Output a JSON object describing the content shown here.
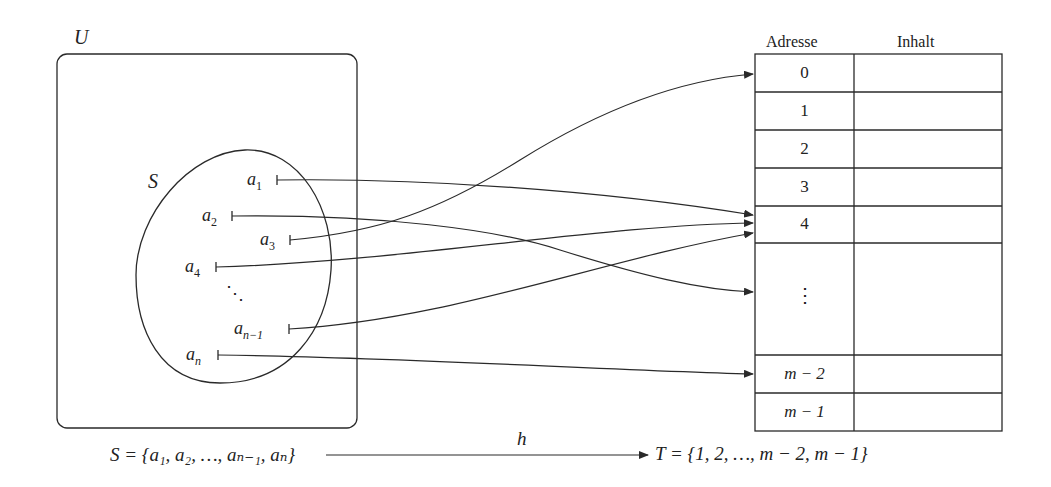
{
  "diagram": {
    "universe": {
      "label": "U"
    },
    "set_s": {
      "label": "S",
      "elements": [
        {
          "name": "a1",
          "base": "a",
          "sub": "1",
          "x": 277,
          "y": 180,
          "target_index": 4,
          "target_y": 215
        },
        {
          "name": "a2",
          "base": "a",
          "sub": "2",
          "x": 232,
          "y": 216,
          "target_index": "vdots",
          "target_y": 292
        },
        {
          "name": "a3",
          "base": "a",
          "sub": "3",
          "x": 290,
          "y": 240,
          "target_index": 0,
          "target_y": 74
        },
        {
          "name": "a4",
          "base": "a",
          "sub": "4",
          "x": 216,
          "y": 267,
          "target_index": 4,
          "target_y": 223
        },
        {
          "name": "dots",
          "base": "⋱",
          "sub": "",
          "x": 236,
          "y": 295
        },
        {
          "name": "a_n-1",
          "base": "a",
          "sub": "n−1",
          "x": 289,
          "y": 329,
          "target_index": 4,
          "target_y": 233
        },
        {
          "name": "a_n",
          "base": "a",
          "sub": "n",
          "x": 218,
          "y": 355,
          "target_index": "m−2",
          "target_y": 374
        }
      ]
    },
    "table": {
      "headers": [
        "Adresse",
        "Inhalt"
      ],
      "rows": [
        {
          "address": "0",
          "content": ""
        },
        {
          "address": "1",
          "content": ""
        },
        {
          "address": "2",
          "content": ""
        },
        {
          "address": "3",
          "content": ""
        },
        {
          "address": "4",
          "content": ""
        },
        {
          "address": "⋮",
          "content": ""
        },
        {
          "address": "m − 2",
          "content": ""
        },
        {
          "address": "m − 1",
          "content": ""
        }
      ]
    },
    "bottom": {
      "domain": "S = {a₁, a₂, …, aₙ₋₁, aₙ}",
      "function": "h",
      "codomain": "T = {1, 2, …, m − 2, m − 1}"
    }
  }
}
